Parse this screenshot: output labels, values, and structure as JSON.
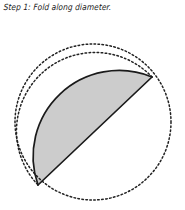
{
  "caption": {
    "text": "Step 1: Fold along diameter."
  },
  "figure": {
    "background_color": "#ffffff",
    "stroke_color": "#1a1a1a",
    "fold_fill_color": "#cccccc",
    "dotted_stroke_color": "#222222",
    "circle": {
      "label": "original-circle-outline",
      "center_x": 93,
      "center_y": 122,
      "radius": 78,
      "style": "dotted"
    },
    "fold_line": {
      "label": "fold-diameter-line",
      "x1": 152,
      "y1": 77,
      "x2": 38,
      "y2": 185,
      "style": "solid"
    },
    "folded_half": {
      "label": "folded-half-disc",
      "fill": "#cccccc",
      "outline": "solid",
      "bulge_direction": "upper-left"
    },
    "inner_arc": {
      "label": "hidden-circle-arc",
      "style": "dotted"
    }
  }
}
